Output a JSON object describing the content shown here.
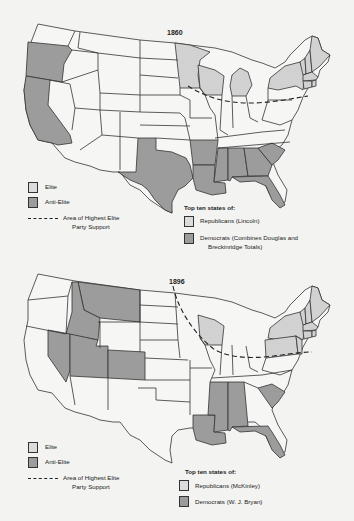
{
  "maps": [
    {
      "year": "1860",
      "elite_states": [
        "Minnesota",
        "Wisconsin",
        "Michigan",
        "New York",
        "Vermont",
        "New Hampshire",
        "Maine",
        "Massachusetts",
        "Rhode Island",
        "Connecticut"
      ],
      "anti_elite_states": [
        "Oregon",
        "California",
        "Texas",
        "Arkansas",
        "Louisiana",
        "Mississippi",
        "Alabama",
        "Georgia",
        "South Carolina",
        "Florida"
      ],
      "legend": {
        "elite": "Elite",
        "anti_elite": "Anti-Elite",
        "line_1": "Area of Highest Elite",
        "line_2": "Party Support"
      },
      "top_ten": {
        "title": "Top ten states of:",
        "republicans": "Republicans (Lincoln)",
        "democrats_1": "Democrats (Combines Douglas and",
        "democrats_2": "Breckinridge Totals)"
      }
    },
    {
      "year": "1896",
      "elite_states": [
        "Wisconsin",
        "New York",
        "Pennsylvania",
        "Vermont",
        "New Hampshire",
        "Maine",
        "Massachusetts",
        "Rhode Island",
        "Connecticut",
        "New Jersey"
      ],
      "anti_elite_states": [
        "Montana",
        "Idaho",
        "Nevada",
        "Utah",
        "Colorado",
        "Louisiana",
        "Mississippi",
        "Alabama",
        "South Carolina",
        "Florida"
      ],
      "legend": {
        "elite": "Elite",
        "anti_elite": "Anti-Elite",
        "line_1": "Area of Highest Elite",
        "line_2": "Party Support"
      },
      "top_ten": {
        "title": "Top ten states of:",
        "republicans": "Republicans (McKinley)",
        "democrats_1": "Democrats (W. J. Bryan)"
      }
    }
  ],
  "colors": {
    "background": "#f3f3f1",
    "anti_elite_fill": "#9c9c9c",
    "elite_fill": "#d6d6d6",
    "outline": "#333333"
  }
}
